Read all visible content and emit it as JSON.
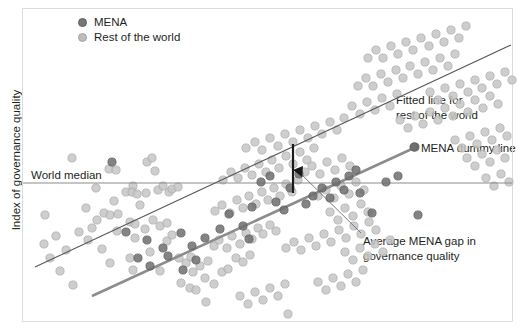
{
  "chart_data": {
    "type": "scatter",
    "title": "",
    "xlabel": "",
    "ylabel": "Index of governance quality",
    "grid": false,
    "legend_position": "top-left",
    "legend": [
      {
        "key": "mena",
        "label": "MENA",
        "color": "#767676"
      },
      {
        "key": "row",
        "label": "Rest of the world",
        "color": "#bdbdbd"
      }
    ],
    "annotations": [
      {
        "key": "fitted_line_label",
        "text_line1": "Fitted line for",
        "text_line2": "rest of the world"
      },
      {
        "key": "dummy_line_label",
        "text_line1": "MENA dummy line",
        "text_line2": ""
      },
      {
        "key": "gap_label",
        "text_line1": "Average MENA gap in",
        "text_line2": "governance quality"
      },
      {
        "key": "world_median_label",
        "text_line1": "World median",
        "text_line2": ""
      }
    ],
    "reference_lines": [
      {
        "key": "world_median",
        "orientation": "horizontal",
        "label": "World median",
        "color": "#8c8c8c"
      },
      {
        "key": "fitted_rest_of_world",
        "orientation": "sloped",
        "label": "Fitted line for rest of the world",
        "color": "#58585a"
      },
      {
        "key": "mena_dummy",
        "orientation": "sloped",
        "label": "MENA dummy line",
        "color": "#8c8c8c"
      }
    ],
    "series": [
      {
        "name": "Rest of the world",
        "color": "#bdbdbd",
        "points": [
          [
            72,
            158
          ],
          [
            109,
            169
          ],
          [
            116,
            170
          ],
          [
            133,
            186
          ],
          [
            147,
            162
          ],
          [
            152,
            158
          ],
          [
            155,
            171
          ],
          [
            96,
            188
          ],
          [
            114,
            201
          ],
          [
            126,
            192
          ],
          [
            132,
            192
          ],
          [
            137,
            194
          ],
          [
            146,
            193
          ],
          [
            158,
            190
          ],
          [
            163,
            186
          ],
          [
            169,
            192
          ],
          [
            172,
            189
          ],
          [
            178,
            187
          ],
          [
            140,
            205
          ],
          [
            45,
            215
          ],
          [
            86,
            208
          ],
          [
            104,
            213
          ],
          [
            110,
            215
          ],
          [
            118,
            214
          ],
          [
            92,
            228
          ],
          [
            117,
            231
          ],
          [
            130,
            222
          ],
          [
            135,
            224
          ],
          [
            145,
            229
          ],
          [
            153,
            220
          ],
          [
            160,
            226
          ],
          [
            167,
            223
          ],
          [
            135,
            238
          ],
          [
            167,
            241
          ],
          [
            172,
            235
          ],
          [
            102,
            249
          ],
          [
            110,
            263
          ],
          [
            130,
            258
          ],
          [
            150,
            252
          ],
          [
            133,
            270
          ],
          [
            60,
            271
          ],
          [
            73,
            285
          ],
          [
            160,
            271
          ],
          [
            179,
            258
          ],
          [
            186,
            263
          ],
          [
            191,
            257
          ],
          [
            193,
            272
          ],
          [
            200,
            266
          ],
          [
            208,
            261
          ],
          [
            181,
            283
          ],
          [
            190,
            288
          ],
          [
            196,
            290
          ],
          [
            205,
            278
          ],
          [
            214,
            284
          ],
          [
            222,
            272
          ],
          [
            228,
            269
          ],
          [
            236,
            258
          ],
          [
            243,
            262
          ],
          [
            250,
            255
          ],
          [
            214,
            246
          ],
          [
            219,
            240
          ],
          [
            227,
            248
          ],
          [
            232,
            236
          ],
          [
            240,
            244
          ],
          [
            246,
            233
          ],
          [
            252,
            239
          ],
          [
            258,
            228
          ],
          [
            263,
            234
          ],
          [
            270,
            225
          ],
          [
            276,
            231
          ],
          [
            215,
            211
          ],
          [
            222,
            205
          ],
          [
            230,
            213
          ],
          [
            237,
            200
          ],
          [
            243,
            208
          ],
          [
            249,
            196
          ],
          [
            256,
            204
          ],
          [
            262,
            192
          ],
          [
            268,
            200
          ],
          [
            274,
            188
          ],
          [
            280,
            196
          ],
          [
            286,
            184
          ],
          [
            292,
            192
          ],
          [
            298,
            180
          ],
          [
            223,
            180
          ],
          [
            231,
            172
          ],
          [
            238,
            178
          ],
          [
            245,
            168
          ],
          [
            252,
            175
          ],
          [
            259,
            164
          ],
          [
            266,
            172
          ],
          [
            272,
            160
          ],
          [
            279,
            168
          ],
          [
            286,
            156
          ],
          [
            293,
            164
          ],
          [
            300,
            152
          ],
          [
            307,
            160
          ],
          [
            314,
            148
          ],
          [
            246,
            148
          ],
          [
            255,
            142
          ],
          [
            262,
            150
          ],
          [
            270,
            138
          ],
          [
            278,
            146
          ],
          [
            285,
            134
          ],
          [
            293,
            142
          ],
          [
            300,
            130
          ],
          [
            308,
            138
          ],
          [
            315,
            126
          ],
          [
            322,
            134
          ],
          [
            330,
            122
          ],
          [
            337,
            130
          ],
          [
            344,
            118
          ],
          [
            305,
            172
          ],
          [
            312,
            166
          ],
          [
            320,
            174
          ],
          [
            327,
            162
          ],
          [
            335,
            170
          ],
          [
            342,
            158
          ],
          [
            350,
            166
          ],
          [
            318,
            196
          ],
          [
            326,
            190
          ],
          [
            334,
            198
          ],
          [
            341,
            186
          ],
          [
            349,
            194
          ],
          [
            356,
            182
          ],
          [
            364,
            190
          ],
          [
            330,
            212
          ],
          [
            338,
            220
          ],
          [
            345,
            208
          ],
          [
            353,
            216
          ],
          [
            361,
            204
          ],
          [
            368,
            212
          ],
          [
            286,
            248
          ],
          [
            294,
            242
          ],
          [
            301,
            250
          ],
          [
            309,
            238
          ],
          [
            316,
            246
          ],
          [
            324,
            234
          ],
          [
            331,
            242
          ],
          [
            339,
            230
          ],
          [
            346,
            238
          ],
          [
            354,
            226
          ],
          [
            361,
            234
          ],
          [
            369,
            222
          ],
          [
            376,
            230
          ],
          [
            352,
            106
          ],
          [
            360,
            114
          ],
          [
            367,
            102
          ],
          [
            375,
            110
          ],
          [
            382,
            98
          ],
          [
            390,
            106
          ],
          [
            397,
            94
          ],
          [
            358,
            86
          ],
          [
            366,
            78
          ],
          [
            373,
            86
          ],
          [
            381,
            74
          ],
          [
            388,
            82
          ],
          [
            396,
            70
          ],
          [
            403,
            78
          ],
          [
            410,
            66
          ],
          [
            418,
            74
          ],
          [
            425,
            62
          ],
          [
            433,
            70
          ],
          [
            440,
            58
          ],
          [
            448,
            66
          ],
          [
            455,
            54
          ],
          [
            368,
            58
          ],
          [
            376,
            50
          ],
          [
            383,
            58
          ],
          [
            391,
            46
          ],
          [
            398,
            54
          ],
          [
            406,
            42
          ],
          [
            413,
            50
          ],
          [
            421,
            38
          ],
          [
            429,
            46
          ],
          [
            436,
            34
          ],
          [
            444,
            42
          ],
          [
            451,
            30
          ],
          [
            459,
            38
          ],
          [
            466,
            26
          ],
          [
            430,
            92
          ],
          [
            438,
            100
          ],
          [
            445,
            88
          ],
          [
            453,
            96
          ],
          [
            460,
            84
          ],
          [
            468,
            92
          ],
          [
            475,
            80
          ],
          [
            482,
            88
          ],
          [
            490,
            76
          ],
          [
            497,
            84
          ],
          [
            505,
            72
          ],
          [
            512,
            80
          ],
          [
            400,
            120
          ],
          [
            408,
            128
          ],
          [
            415,
            116
          ],
          [
            423,
            124
          ],
          [
            430,
            112
          ],
          [
            438,
            120
          ],
          [
            445,
            108
          ],
          [
            453,
            116
          ],
          [
            460,
            104
          ],
          [
            468,
            112
          ],
          [
            475,
            100
          ],
          [
            483,
            108
          ],
          [
            490,
            96
          ],
          [
            498,
            104
          ],
          [
            206,
            302
          ],
          [
            288,
            314
          ],
          [
            455,
            140
          ],
          [
            462,
            148
          ],
          [
            470,
            136
          ],
          [
            477,
            144
          ],
          [
            485,
            132
          ],
          [
            492,
            140
          ],
          [
            500,
            128
          ],
          [
            507,
            136
          ],
          [
            467,
            158
          ],
          [
            475,
            166
          ],
          [
            482,
            154
          ],
          [
            490,
            162
          ],
          [
            497,
            150
          ],
          [
            505,
            158
          ],
          [
            486,
            178
          ],
          [
            494,
            186
          ],
          [
            501,
            174
          ],
          [
            509,
            182
          ],
          [
            44,
            244
          ],
          [
            56,
            236
          ],
          [
            66,
            250
          ],
          [
            50,
            258
          ],
          [
            79,
            232
          ],
          [
            88,
            240
          ],
          [
            97,
            220
          ],
          [
            345,
            252
          ],
          [
            353,
            260
          ],
          [
            360,
            248
          ],
          [
            368,
            256
          ],
          [
            375,
            244
          ],
          [
            383,
            252
          ],
          [
            390,
            240
          ],
          [
            318,
            282
          ],
          [
            326,
            290
          ],
          [
            333,
            278
          ],
          [
            341,
            286
          ],
          [
            348,
            274
          ],
          [
            356,
            282
          ],
          [
            363,
            270
          ],
          [
            240,
            296
          ],
          [
            248,
            304
          ],
          [
            255,
            292
          ],
          [
            263,
            300
          ],
          [
            270,
            288
          ],
          [
            278,
            296
          ],
          [
            285,
            284
          ]
        ]
      },
      {
        "name": "MENA",
        "color": "#6e6e6e",
        "points": [
          [
            112,
            162
          ],
          [
            126,
            232
          ],
          [
            147,
            240
          ],
          [
            220,
            229
          ],
          [
            243,
            226
          ],
          [
            249,
            239
          ],
          [
            261,
            182
          ],
          [
            270,
            176
          ],
          [
            290,
            188
          ],
          [
            299,
            174
          ],
          [
            313,
            196
          ],
          [
            322,
            188
          ],
          [
            336,
            182
          ],
          [
            349,
            176
          ],
          [
            360,
            193
          ],
          [
            372,
            213
          ],
          [
            418,
            215
          ],
          [
            386,
            182
          ],
          [
            398,
            176
          ],
          [
            415,
            147
          ],
          [
            205,
            238
          ],
          [
            163,
            248
          ],
          [
            181,
            233
          ],
          [
            192,
            246
          ],
          [
            229,
            214
          ],
          [
            252,
            207
          ],
          [
            276,
            202
          ],
          [
            284,
            210
          ],
          [
            306,
            204
          ],
          [
            330,
            198
          ],
          [
            344,
            190
          ],
          [
            356,
            170
          ],
          [
            138,
            258
          ],
          [
            150,
            266
          ],
          [
            168,
            256
          ],
          [
            183,
            270
          ],
          [
            196,
            260
          ]
        ]
      }
    ],
    "axes": {
      "frame": {
        "left": 22,
        "top": 8,
        "right": 513,
        "bottom": 322,
        "color": "#dcdcdc"
      }
    }
  }
}
